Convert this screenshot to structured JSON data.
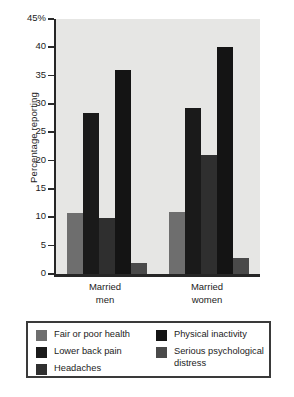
{
  "chart_data": {
    "type": "bar",
    "title": "",
    "xlabel": "",
    "ylabel": "Percentage reporting",
    "ylim": [
      0,
      45
    ],
    "yticks": [
      0,
      5,
      10,
      15,
      20,
      25,
      30,
      35,
      40,
      45
    ],
    "ytick_labels": [
      "0",
      "5",
      "10",
      "15",
      "20",
      "25",
      "30",
      "35",
      "40",
      "45%"
    ],
    "grid": false,
    "legend_position": "bottom",
    "categories": [
      "Married men",
      "Married women"
    ],
    "category_lines": [
      [
        "Married",
        "men"
      ],
      [
        "Married",
        "women"
      ]
    ],
    "series": [
      {
        "name": "Fair or poor health",
        "color": "#6e6e6e",
        "values": [
          10.8,
          10.9
        ]
      },
      {
        "name": "Lower back pain",
        "color": "#1a1a1a",
        "values": [
          28.4,
          29.3
        ]
      },
      {
        "name": "Headaches",
        "color": "#2f2f2f",
        "values": [
          9.8,
          21.0
        ]
      },
      {
        "name": "Physical inactivity",
        "color": "#141414",
        "values": [
          36.0,
          40.1
        ]
      },
      {
        "name": "Serious psychological distress",
        "color": "#4a4a4a",
        "values": [
          2.0,
          2.9
        ]
      }
    ]
  },
  "legend": {
    "columns": [
      [
        {
          "label": "Fair or poor health",
          "color": "#6e6e6e"
        },
        {
          "label": "Lower back pain",
          "color": "#1a1a1a"
        },
        {
          "label": "Headaches",
          "color": "#2f2f2f"
        }
      ],
      [
        {
          "label": "Physical inactivity",
          "color": "#141414"
        },
        {
          "label": "Serious psychological distress",
          "color": "#4a4a4a"
        }
      ]
    ]
  },
  "style": {
    "plot_background": "#e6e6e4",
    "axis_color": "#262626",
    "legend_border": "#3a3a3a",
    "page_background": "#ffffff"
  }
}
